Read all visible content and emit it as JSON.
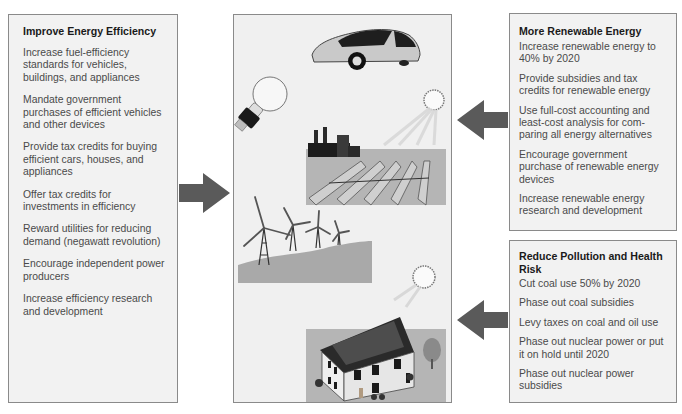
{
  "left_panel": {
    "title": "Improve Energy Efficiency",
    "items": [
      "Increase fuel-efficiency standards for vehicles, buildings, and appliances",
      "Mandate government purchases of efficient vehicles and other devices",
      "Provide tax credits for buying efficient cars, houses, and appliances",
      "Offer tax credits for investments in efficiency",
      "Reward utilities for reducing demand (negawatt revolution)",
      "Encourage independent power producers",
      "Increase efficiency research and development"
    ]
  },
  "right_top_panel": {
    "title": "More Renewable Energy",
    "items": [
      "Increase renewable energy to 40% by 2020",
      "Provide subsidies and tax credits for renewable energy",
      "Use full-cost accounting and least-cost analysis for com-paring all energy alternatives",
      "Encourage government purchase of renewable energy devices",
      "Increase renewable energy research and development"
    ]
  },
  "right_bottom_panel": {
    "title": "Reduce Pollution and Health Risk",
    "items": [
      "Cut coal use 50% by 2020",
      "Phase out coal subsidies",
      "Levy taxes on coal and oil use",
      "Phase out nuclear power or put it on hold until 2020",
      "Phase out nuclear power subsidies"
    ]
  },
  "center_panel": {
    "illustrations": [
      "efficient-car",
      "compact-fluorescent-bulb",
      "solar-thermal-plant",
      "wind-turbines",
      "solar-house"
    ]
  },
  "colors": {
    "arrow": "#5a5a5a",
    "panel_bg": "#f2f2f2",
    "border": "#8a8a8a",
    "ground": "#b8b8b8"
  }
}
